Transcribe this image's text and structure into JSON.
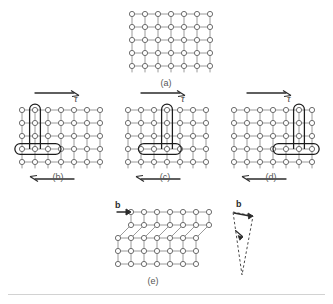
{
  "figure": {
    "lattice": {
      "node_shape": "open-circle",
      "node_radius": 2.6,
      "node_fill": "#ffffff",
      "node_stroke": "#6e6e6e",
      "bond_stroke": "#9a9a9a",
      "spacing_x": 13,
      "spacing_y": 13,
      "columns": 7,
      "rows": 5
    },
    "colors": {
      "node_stroke": "#6e6e6e",
      "bond": "#9a9a9a",
      "highlight": "#1c1c1c",
      "arrow": "#2b2b2b",
      "caption": "#555555",
      "rule": "#d2d2d2"
    }
  },
  "panels": [
    {
      "id": "a",
      "caption": "(a)",
      "description": "perfect crystal lattice, no dislocation",
      "columns": 7,
      "rows": 5,
      "origin_x": 132,
      "origin_y": 14,
      "has_shear_arrows": false,
      "dislocation_column": null,
      "half_plane_rows": 0,
      "slip_step": false
    },
    {
      "id": "b",
      "caption": "(b)",
      "description": "edge dislocation at left, shear stress applied",
      "columns": 7,
      "rows": 5,
      "origin_x": 22,
      "origin_y": 110,
      "has_shear_arrows": true,
      "dislocation_column": 2,
      "half_plane_rows": 3,
      "slip_step": false
    },
    {
      "id": "c",
      "caption": "(c)",
      "description": "dislocation glided to centre of crystal",
      "columns": 7,
      "rows": 5,
      "origin_x": 128,
      "origin_y": 110,
      "has_shear_arrows": true,
      "dislocation_column": 4,
      "half_plane_rows": 3,
      "slip_step": false
    },
    {
      "id": "d",
      "caption": "(d)",
      "description": "dislocation approaching right free surface",
      "columns": 7,
      "rows": 5,
      "origin_x": 234,
      "origin_y": 110,
      "has_shear_arrows": true,
      "dislocation_column": 6,
      "half_plane_rows": 3,
      "slip_step": false
    },
    {
      "id": "e",
      "caption": "(e)",
      "description": "dislocation exited leaving unit slip step of one Burgers vector",
      "columns": 7,
      "rows": 5,
      "origin_x": 118,
      "origin_y": 212,
      "has_shear_arrows": false,
      "dislocation_column": null,
      "half_plane_rows": 0,
      "slip_step": true,
      "step_rows": 2,
      "step_offset": 13
    }
  ],
  "labels": {
    "tau_symbol": "τ",
    "burgers_symbol": "b",
    "panel_a": "(a)",
    "panel_b": "(b)",
    "panel_c": "(c)",
    "panel_d": "(d)",
    "panel_e": "(e)"
  },
  "annotations": {
    "shear_top": {
      "name": "top-shear-arrow",
      "direction": "right"
    },
    "shear_bottom": {
      "name": "bottom-shear-arrow",
      "direction": "left"
    },
    "burgers_e": {
      "name": "burgers-vector-arrow",
      "direction": "right"
    },
    "wedge": {
      "name": "burgers-vector-wedge",
      "style": "dashed",
      "description": "narrow dashed wedge with burgers vector b at top and included angle marked",
      "b_label": "b",
      "apex_x": 242,
      "apex_y": 275,
      "top_left_x": 233,
      "top_left_y": 212,
      "top_right_x": 253,
      "top_right_y": 216
    }
  }
}
